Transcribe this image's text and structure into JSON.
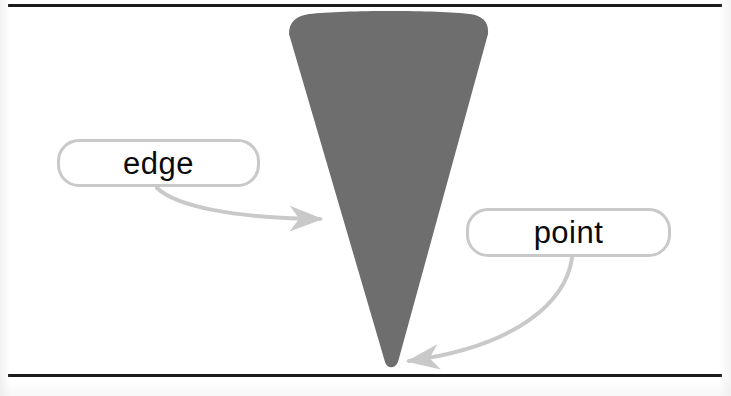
{
  "figure": {
    "background_color": "#ffffff",
    "rule_color": "#1b1b1b",
    "shape": {
      "name": "cone",
      "fill_color": "#6e6e6e",
      "description": "downward pointing cone / triangular wedge with rounded top arc",
      "apex": {
        "x": 390,
        "y": 366
      },
      "top_left": {
        "x": 289,
        "y": 17
      },
      "top_right": {
        "x": 488,
        "y": 19
      }
    },
    "rules": [
      {
        "id": "rule-top",
        "y": 4
      },
      {
        "id": "rule-bottom",
        "y": 374
      }
    ],
    "callouts": [
      {
        "id": "edge",
        "label": "edge",
        "border_color": "#c9c9c9",
        "fill_color": "#ffffff",
        "x": 57,
        "y": 139,
        "width": 203,
        "height": 48,
        "arrow": {
          "color": "#c9c9c9",
          "from": {
            "x": 157,
            "y": 188
          },
          "to": {
            "x": 332,
            "y": 219
          }
        }
      },
      {
        "id": "point",
        "label": "point",
        "border_color": "#c9c9c9",
        "fill_color": "#ffffff",
        "x": 466,
        "y": 208,
        "width": 205,
        "height": 49,
        "arrow": {
          "color": "#c9c9c9",
          "from": {
            "x": 572,
            "y": 258
          },
          "to": {
            "x": 397,
            "y": 362
          }
        }
      }
    ]
  }
}
